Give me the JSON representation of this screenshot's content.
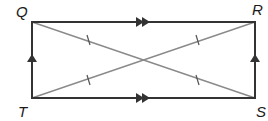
{
  "diagram": {
    "type": "rectangle with diagonals",
    "vertices": {
      "Q": {
        "label": "Q",
        "position": "top-left"
      },
      "R": {
        "label": "R",
        "position": "top-right"
      },
      "S": {
        "label": "S",
        "position": "bottom-right"
      },
      "T": {
        "label": "T",
        "position": "bottom-left"
      }
    },
    "sides": [
      {
        "segment": "QR",
        "marker": "double-arrow"
      },
      {
        "segment": "TS",
        "marker": "double-arrow"
      },
      {
        "segment": "TQ",
        "marker": "single-arrow"
      },
      {
        "segment": "SR",
        "marker": "single-arrow"
      }
    ],
    "diagonals": [
      {
        "segment": "QS",
        "marker": "single-tick on each half"
      },
      {
        "segment": "TR",
        "marker": "single-tick on each half"
      }
    ],
    "colors": {
      "sides": "#333333",
      "diagonals": "#8a8a8a",
      "labels": "#1a1a1a"
    }
  }
}
